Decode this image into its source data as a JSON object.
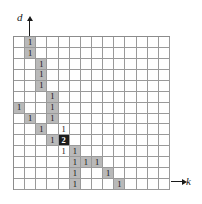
{
  "figure": {
    "type": "grid-diagram",
    "axes": {
      "vertical": {
        "label": "d",
        "name": "d-axis",
        "arrow": "up"
      },
      "horizontal": {
        "label": "k",
        "name": "k-axis",
        "arrow": "right"
      }
    },
    "grid": {
      "columns": 14,
      "rows": 14,
      "line_color": "#9a9a9a",
      "background_color": "#ffffff",
      "shaded_color": "#b9b9b9",
      "dark_color": "#1c1c1c",
      "dark_text_color": "#ffffff"
    },
    "cells": [
      {
        "row": 0,
        "col": 1,
        "value": "1",
        "fill": "shaded"
      },
      {
        "row": 1,
        "col": 1,
        "value": "1",
        "fill": "shaded"
      },
      {
        "row": 2,
        "col": 2,
        "value": "1",
        "fill": "shaded"
      },
      {
        "row": 3,
        "col": 2,
        "value": "1",
        "fill": "shaded"
      },
      {
        "row": 4,
        "col": 2,
        "value": "1",
        "fill": "shaded"
      },
      {
        "row": 5,
        "col": 3,
        "value": "1",
        "fill": "shaded"
      },
      {
        "row": 6,
        "col": 0,
        "value": "1",
        "fill": "shaded"
      },
      {
        "row": 6,
        "col": 3,
        "value": "1",
        "fill": "shaded"
      },
      {
        "row": 7,
        "col": 1,
        "value": "1",
        "fill": "shaded"
      },
      {
        "row": 7,
        "col": 3,
        "value": "1",
        "fill": "shaded"
      },
      {
        "row": 8,
        "col": 2,
        "value": "1",
        "fill": "shaded"
      },
      {
        "row": 8,
        "col": 4,
        "value": "1",
        "fill": "none"
      },
      {
        "row": 9,
        "col": 3,
        "value": "1",
        "fill": "shaded"
      },
      {
        "row": 9,
        "col": 4,
        "value": "2",
        "fill": "dark"
      },
      {
        "row": 10,
        "col": 4,
        "value": "1",
        "fill": "none"
      },
      {
        "row": 10,
        "col": 5,
        "value": "1",
        "fill": "shaded"
      },
      {
        "row": 11,
        "col": 5,
        "value": "1",
        "fill": "shaded"
      },
      {
        "row": 11,
        "col": 6,
        "value": "1",
        "fill": "shaded"
      },
      {
        "row": 11,
        "col": 7,
        "value": "1",
        "fill": "shaded"
      },
      {
        "row": 12,
        "col": 5,
        "value": "1",
        "fill": "shaded"
      },
      {
        "row": 12,
        "col": 8,
        "value": "1",
        "fill": "shaded"
      },
      {
        "row": 13,
        "col": 5,
        "value": "1",
        "fill": "shaded"
      },
      {
        "row": 13,
        "col": 9,
        "value": "1",
        "fill": "shaded"
      }
    ]
  }
}
